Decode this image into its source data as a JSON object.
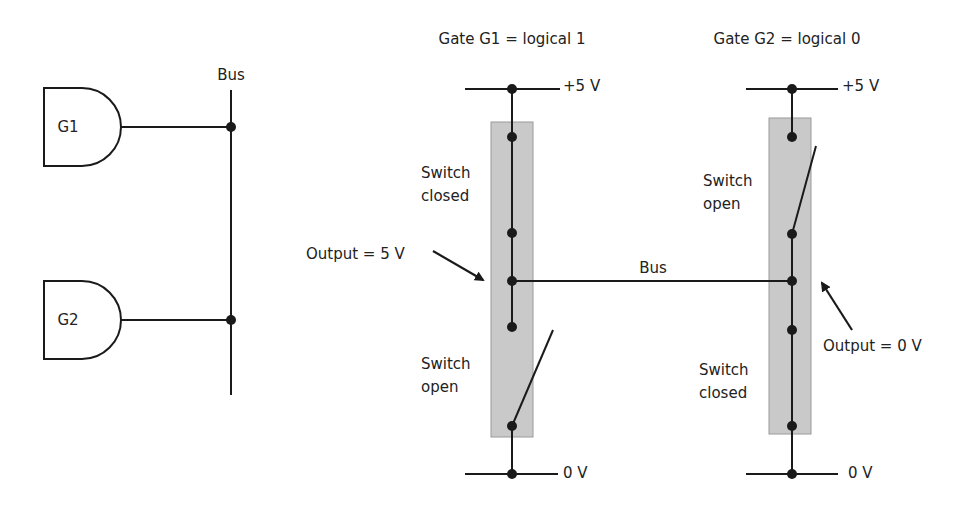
{
  "left_diagram": {
    "gates": [
      {
        "id": "G1",
        "label": "G1"
      },
      {
        "id": "G2",
        "label": "G2"
      }
    ],
    "bus_label": "Bus"
  },
  "right_diagram": {
    "gate1": {
      "title": "Gate G1 = logical 1",
      "supply_label": "+5 V",
      "ground_label": "0 V",
      "upper_switch": "Switch\nclosed",
      "upper_switch_line1": "Switch",
      "upper_switch_line2": "closed",
      "lower_switch_line1": "Switch",
      "lower_switch_line2": "open",
      "output_label": "Output = 5 V"
    },
    "gate2": {
      "title": "Gate G2 = logical 0",
      "supply_label": "+5 V",
      "ground_label": "0 V",
      "upper_switch_line1": "Switch",
      "upper_switch_line2": "open",
      "lower_switch_line1": "Switch",
      "lower_switch_line2": "closed",
      "output_label": "Output = 0 V"
    },
    "bus_label": "Bus"
  },
  "colors": {
    "line": "#1a1a1a",
    "switch_box_fill": "#c9c9c9",
    "switch_box_border": "#9a9a9a"
  }
}
